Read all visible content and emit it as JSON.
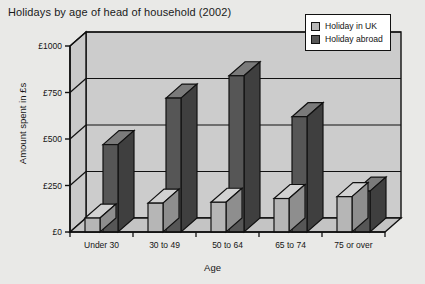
{
  "chart_data": {
    "type": "bar",
    "title": "Holidays by age of head of household (2002)",
    "xlabel": "Age",
    "ylabel": "Amount spent in £s",
    "categories": [
      "Under 30",
      "30 to 49",
      "50 to 64",
      "65 to 74",
      "75 or over"
    ],
    "yticks": [
      "£0",
      "£250",
      "£500",
      "£750",
      "£1000"
    ],
    "ytick_values": [
      0,
      250,
      500,
      750,
      1000
    ],
    "ylim": [
      0,
      1000
    ],
    "grid": true,
    "legend_position": "top-right",
    "three_d": true,
    "series": [
      {
        "name": "Holiday in UK",
        "color": "#b6b6b6",
        "values": [
          75,
          155,
          160,
          180,
          190
        ]
      },
      {
        "name": "Holiday abroad",
        "color": "#565656",
        "values": [
          470,
          720,
          840,
          620,
          220
        ]
      }
    ]
  },
  "colors": {
    "background": "#e9e9e7",
    "plot_wall": "#cccccc",
    "plot_floor": "#c4c4c4",
    "axis": "#111111",
    "uk_bar": "#b6b6b6",
    "abroad_bar": "#565656"
  }
}
